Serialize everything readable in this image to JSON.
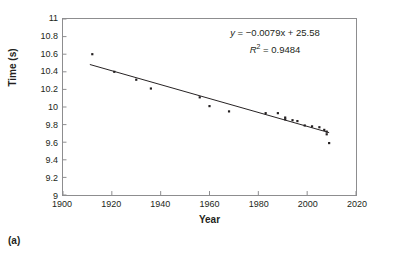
{
  "figure": {
    "subfigure_label": "(a)"
  },
  "chart_data": {
    "type": "scatter",
    "title": "",
    "xlabel": "Year",
    "ylabel": "Time (s)",
    "xlim": [
      1900,
      2020
    ],
    "ylim": [
      9,
      11
    ],
    "grid": false,
    "legend": "none",
    "xticks": [
      1900,
      1920,
      1940,
      1960,
      1980,
      2000,
      2020
    ],
    "xtick_labels": [
      "1900",
      "1920",
      "1940",
      "1960",
      "1980",
      "2000",
      "2020"
    ],
    "yticks": [
      9,
      9.2,
      9.4,
      9.6,
      9.8,
      10,
      10.2,
      10.4,
      10.6,
      10.8,
      11
    ],
    "ytick_labels": [
      "9",
      "9.2",
      "9.4",
      "9.6",
      "9.8",
      "10",
      "10.2",
      "10.4",
      "10.6",
      "10.8",
      "11"
    ],
    "marker": "square",
    "marker_color": "#231f20",
    "marker_size": 2.2,
    "series": [
      {
        "name": "100 m world record",
        "x": [
          1912,
          1921,
          1930,
          1936,
          1956,
          1960,
          1968,
          1983,
          1988,
          1991,
          1991,
          1994,
          1996,
          1999,
          2002,
          2005,
          2007,
          2008,
          2008,
          2009
        ],
        "y": [
          10.6,
          10.4,
          10.31,
          10.21,
          10.11,
          10.01,
          9.95,
          9.93,
          9.93,
          9.88,
          9.86,
          9.85,
          9.84,
          9.79,
          9.78,
          9.77,
          9.74,
          9.72,
          9.69,
          9.59
        ]
      }
    ],
    "trendline": {
      "type": "linear",
      "slope": -0.0079,
      "intercept": 25.58,
      "r_squared": 0.9484,
      "x_start": 1911,
      "x_end": 2009,
      "color": "#231f20",
      "equation_text": "y = −0.0079x + 25.58",
      "equation_y_symbol": "y",
      "equation_body": " = −0.0079x + 25.58",
      "r2_symbol": "R",
      "r2_superscript": "2",
      "r2_body": " = 0.9484"
    }
  }
}
